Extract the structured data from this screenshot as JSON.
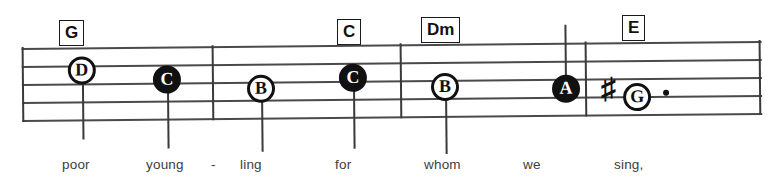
{
  "sheet": {
    "type": "music-notation-excerpt",
    "staff_lines": 5,
    "colors": {
      "ink": "#111111",
      "staff": "#4a4a4a",
      "lyric": "#3d3d3d",
      "paper": "#ffffff"
    }
  },
  "chords": [
    {
      "label": "G",
      "x": 59,
      "y": 20
    },
    {
      "label": "C",
      "x": 337,
      "y": 19
    },
    {
      "label": "Dm",
      "x": 421,
      "y": 17
    },
    {
      "label": "E",
      "x": 622,
      "y": 15
    }
  ],
  "barlines": [
    {
      "name": "staff-start",
      "x": 0
    },
    {
      "name": "barline-1",
      "x": 190
    },
    {
      "name": "barline-2",
      "x": 378
    },
    {
      "name": "barline-3",
      "x": 563
    },
    {
      "name": "staff-end",
      "x": 737
    }
  ],
  "notes": [
    {
      "letter": "D",
      "head": "open",
      "x": 60,
      "y": 9,
      "stem": "down",
      "accidental": "",
      "dotted": false
    },
    {
      "letter": "C",
      "head": "filled",
      "x": 145,
      "y": 19,
      "stem": "down",
      "accidental": "",
      "dotted": false
    },
    {
      "letter": "B",
      "head": "open",
      "x": 239,
      "y": 29,
      "stem": "down",
      "accidental": "",
      "dotted": false
    },
    {
      "letter": "C",
      "head": "filled",
      "x": 331,
      "y": 19,
      "stem": "down",
      "accidental": "",
      "dotted": false
    },
    {
      "letter": "B",
      "head": "open",
      "x": 423,
      "y": 29,
      "stem": "down",
      "accidental": "",
      "dotted": false
    },
    {
      "letter": "A",
      "head": "filled",
      "x": 517,
      "y": 39,
      "stem": "up",
      "accidental": "",
      "dotted": false
    },
    {
      "letter": "G",
      "head": "open",
      "x": 623,
      "y": 48,
      "stem": "none",
      "accidental": "sharp",
      "dotted": true
    }
  ],
  "accidentals": [
    {
      "symbol": "♯",
      "name": "sharp-sign",
      "x": 601,
      "y": 89
    }
  ],
  "lyrics": [
    {
      "text": "poor",
      "x": 62
    },
    {
      "text": "young",
      "x": 146
    },
    {
      "text": "-",
      "x": 211
    },
    {
      "text": "ling",
      "x": 240
    },
    {
      "text": "for",
      "x": 335
    },
    {
      "text": "whom",
      "x": 424
    },
    {
      "text": "we",
      "x": 523
    },
    {
      "text": "sing,",
      "x": 614
    }
  ],
  "lyrics_baseline_y": 157
}
